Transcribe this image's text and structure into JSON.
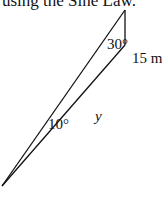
{
  "caption": "using the Sine Law.",
  "diagram": {
    "angle_top": "30°",
    "angle_bottom": "10°",
    "side_vertical": "15 m",
    "side_unknown": "y",
    "stroke_color": "#111111"
  }
}
